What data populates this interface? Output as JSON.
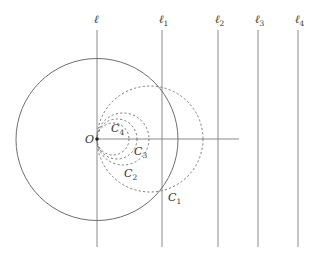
{
  "figure": {
    "width": 314,
    "height": 260,
    "origin": {
      "label": "O",
      "x": 97,
      "y": 139
    },
    "big_circle": {
      "cx": 97,
      "cy": 139.5,
      "r": 81,
      "style": "solid"
    },
    "axis": {
      "x1": 97,
      "y1": 139,
      "x2": 239,
      "y2": 139
    },
    "lines": [
      {
        "id": "l",
        "label": "ℓ",
        "sub": "",
        "x": 97,
        "y1": 30,
        "y2": 247
      },
      {
        "id": "l1",
        "label": "ℓ",
        "sub": "1",
        "x": 162,
        "y1": 30,
        "y2": 247
      },
      {
        "id": "l2",
        "label": "ℓ",
        "sub": "2",
        "x": 218,
        "y1": 30,
        "y2": 247
      },
      {
        "id": "l3",
        "label": "ℓ",
        "sub": "3",
        "x": 258,
        "y1": 30,
        "y2": 247
      },
      {
        "id": "l4",
        "label": "ℓ",
        "sub": "4",
        "x": 298,
        "y1": 30,
        "y2": 247
      }
    ],
    "circles": [
      {
        "id": "C1",
        "label": "C",
        "sub": "1",
        "cx": 150,
        "cy": 139,
        "r": 53,
        "label_x": 168,
        "label_y": 201
      },
      {
        "id": "C2",
        "label": "C",
        "sub": "2",
        "cx": 123,
        "cy": 139,
        "r": 26,
        "label_x": 124,
        "label_y": 177
      },
      {
        "id": "C3",
        "label": "C",
        "sub": "3",
        "cx": 117,
        "cy": 139,
        "r": 20,
        "label_x": 134,
        "label_y": 155
      },
      {
        "id": "C4",
        "label": "C",
        "sub": "4",
        "cx": 113,
        "cy": 139,
        "r": 16,
        "label_x": 111,
        "label_y": 132
      }
    ],
    "colors": {
      "stroke": "#6e6e6e",
      "text": "#333333",
      "background": "#ffffff"
    }
  }
}
